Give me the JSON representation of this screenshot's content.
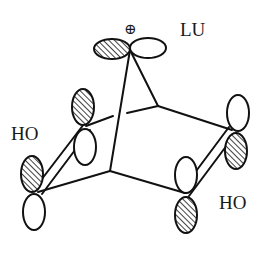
{
  "diagram": {
    "labels": {
      "charge": "⊕",
      "lu": "LU",
      "ho_left": "HO",
      "ho_right": "HO"
    },
    "colors": {
      "line": "#111111",
      "background": "#ffffff",
      "hatch": "#111111"
    },
    "orbitals": [
      {
        "id": "c7-left-lobe",
        "shaded": true
      },
      {
        "id": "c7-right-lobe",
        "shaded": false
      },
      {
        "id": "c2-upper-lobe",
        "shaded": true
      },
      {
        "id": "c2-lower-lobe",
        "shaded": false
      },
      {
        "id": "c3-upper-lobe",
        "shaded": true
      },
      {
        "id": "c3-lower-lobe",
        "shaded": false
      },
      {
        "id": "c5-upper-lobe",
        "shaded": false
      },
      {
        "id": "c5-lower-lobe",
        "shaded": true
      },
      {
        "id": "c6-upper-lobe",
        "shaded": false
      },
      {
        "id": "c6-lower-lobe",
        "shaded": true
      }
    ]
  }
}
